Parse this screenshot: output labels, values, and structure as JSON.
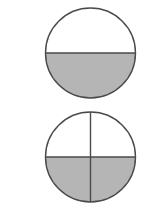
{
  "diagram": {
    "type": "fraction-circles",
    "background": "#ffffff",
    "stroke_color": "#4a4a4a",
    "fill_color": "#b5b5b5",
    "figures": [
      {
        "name": "circle-halves",
        "fraction_shaded": "1/2",
        "parts": 2,
        "shaded_parts": 1,
        "shaded_region": "bottom half",
        "cx": 90.5,
        "cy": 53,
        "r": 45
      },
      {
        "name": "circle-quarters",
        "fraction_shaded": "2/4",
        "parts": 4,
        "shaded_parts": 2,
        "shaded_region": "bottom two quarters",
        "cx": 90.5,
        "cy": 157,
        "r": 45
      }
    ]
  }
}
